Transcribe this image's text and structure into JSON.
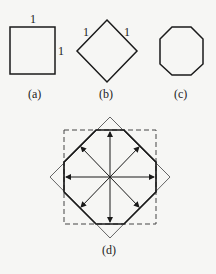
{
  "figures": {
    "a": {
      "caption": "(a)",
      "top_label": "1",
      "side_label": "1"
    },
    "b": {
      "caption": "(b)",
      "left_label": "1",
      "right_label": "1"
    },
    "c": {
      "caption": "(c)"
    },
    "d": {
      "caption": "(d)"
    }
  },
  "colors": {
    "stroke": "#1a1a1a",
    "background": "#f6f6f4"
  }
}
